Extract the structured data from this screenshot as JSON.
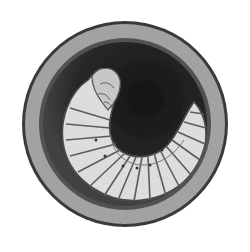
{
  "image": {
    "subject": "larva curled inside round earthen cell",
    "style": "grayscale engraving illustration",
    "colors": {
      "background": "#ffffff",
      "cell_rim_dark": "#3a3a3a",
      "cell_wall": "#a8a8a8",
      "cell_inner_ring": "#505050",
      "cavity_dark": "#1e1e1e",
      "larva_body": "#e8e8e8",
      "segment_lines": "#5a5a5a",
      "spiracles": "#333333"
    }
  }
}
